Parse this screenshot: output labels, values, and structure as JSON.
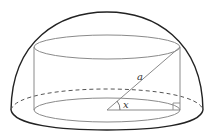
{
  "diagram": {
    "labels": {
      "diagonal": "a",
      "angle": "x"
    },
    "colors": {
      "hemisphere_outline": "#222222",
      "cylinder_lines": "#8a8a8a",
      "background": "#ffffff"
    },
    "elements": [
      "hemisphere",
      "hemisphere-base-ellipse (dashed back half)",
      "cylinder",
      "cylinder-top-ellipse",
      "cylinder-bottom-ellipse",
      "diagonal-a",
      "radius-line",
      "angle-x-arc",
      "right-angle-marker"
    ]
  }
}
